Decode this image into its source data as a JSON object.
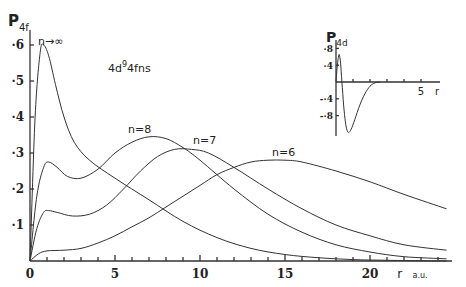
{
  "chart_data": [
    {
      "type": "line",
      "title": "",
      "annotation": "4d 4fns",
      "annotation_config": {
        "base": "4d",
        "sup": "9",
        "rest": "4fns"
      },
      "ylabel": {
        "main": "P",
        "sub": "4f"
      },
      "xlabel": {
        "main": "r",
        "unit": "a.u."
      },
      "xlim": [
        0,
        24.5
      ],
      "ylim": [
        0,
        0.62
      ],
      "x_ticks": [
        0,
        5,
        10,
        15,
        20
      ],
      "x_tick_labels": [
        "0",
        "5",
        "10",
        "15",
        "20"
      ],
      "y_ticks": [
        0.1,
        0.2,
        0.3,
        0.4,
        0.5,
        0.6
      ],
      "y_tick_labels": [
        "·1",
        "·2",
        "·3",
        "·4",
        "·5",
        "·6"
      ],
      "grid": false,
      "legend": "inline labels",
      "series": [
        {
          "name": "n→∞",
          "label": "n→∞",
          "x": [
            0,
            0.3,
            0.6,
            0.8,
            1.1,
            1.5,
            2,
            2.6,
            3.5,
            5,
            7,
            9,
            11,
            13,
            15,
            17,
            19,
            21,
            24.5
          ],
          "y": [
            0,
            0.4,
            0.58,
            0.6,
            0.57,
            0.49,
            0.4,
            0.33,
            0.28,
            0.23,
            0.17,
            0.11,
            0.065,
            0.035,
            0.018,
            0.009,
            0.004,
            0.002,
            0.0
          ]
        },
        {
          "name": "n=8",
          "label": "n=8",
          "x": [
            0,
            0.4,
            0.8,
            1.1,
            1.6,
            2.2,
            3,
            4,
            5,
            6,
            7,
            8,
            9,
            10,
            12,
            14,
            16,
            18,
            20,
            22,
            24.5
          ],
          "y": [
            0,
            0.18,
            0.26,
            0.275,
            0.26,
            0.235,
            0.23,
            0.255,
            0.3,
            0.33,
            0.345,
            0.34,
            0.315,
            0.28,
            0.2,
            0.13,
            0.08,
            0.045,
            0.025,
            0.012,
            0.006
          ]
        },
        {
          "name": "n=7",
          "label": "n=7",
          "x": [
            0,
            0.4,
            0.8,
            1.1,
            1.6,
            2.5,
            3.5,
            4.5,
            5.5,
            6.5,
            7.5,
            8.5,
            9.5,
            10.5,
            12,
            14,
            16,
            18,
            20,
            22,
            24.5
          ],
          "y": [
            0,
            0.09,
            0.135,
            0.14,
            0.135,
            0.125,
            0.13,
            0.155,
            0.2,
            0.25,
            0.29,
            0.31,
            0.31,
            0.3,
            0.26,
            0.2,
            0.145,
            0.1,
            0.07,
            0.045,
            0.03
          ]
        },
        {
          "name": "n=6",
          "label": "n=6",
          "x": [
            0,
            0.5,
            1,
            2,
            3,
            4,
            5,
            6,
            7,
            8,
            9,
            10,
            11,
            12,
            13,
            14,
            15,
            16,
            18,
            20,
            22,
            24.5
          ],
          "y": [
            0,
            0.02,
            0.028,
            0.03,
            0.035,
            0.05,
            0.07,
            0.095,
            0.12,
            0.15,
            0.18,
            0.21,
            0.24,
            0.26,
            0.275,
            0.28,
            0.28,
            0.275,
            0.25,
            0.22,
            0.185,
            0.145
          ]
        }
      ]
    },
    {
      "type": "line",
      "title": "inset",
      "ylabel": {
        "main": "P",
        "sub": "4d"
      },
      "xlabel": {
        "main": "r"
      },
      "xlim": [
        0,
        6
      ],
      "ylim": [
        -1.25,
        0.9
      ],
      "x_ticks": [
        1,
        2,
        3,
        4,
        5
      ],
      "x_tick_labels": [
        "",
        "",
        "",
        "",
        "5"
      ],
      "y_ticks": [
        0.8,
        0.4,
        -0.4,
        -0.8
      ],
      "y_tick_labels": [
        "·8",
        "·4",
        "-·4",
        "-·8"
      ],
      "grid": false,
      "series": [
        {
          "name": "P4d",
          "x": [
            0,
            0.08,
            0.15,
            0.2,
            0.27,
            0.35,
            0.45,
            0.55,
            0.65,
            0.75,
            0.9,
            1.1,
            1.4,
            1.7,
            2.0,
            2.3,
            2.6
          ],
          "y": [
            0,
            0.4,
            0.62,
            0.64,
            0.45,
            0.0,
            -0.55,
            -0.95,
            -1.15,
            -1.2,
            -1.12,
            -0.9,
            -0.55,
            -0.28,
            -0.1,
            -0.02,
            0.0
          ]
        }
      ]
    }
  ]
}
